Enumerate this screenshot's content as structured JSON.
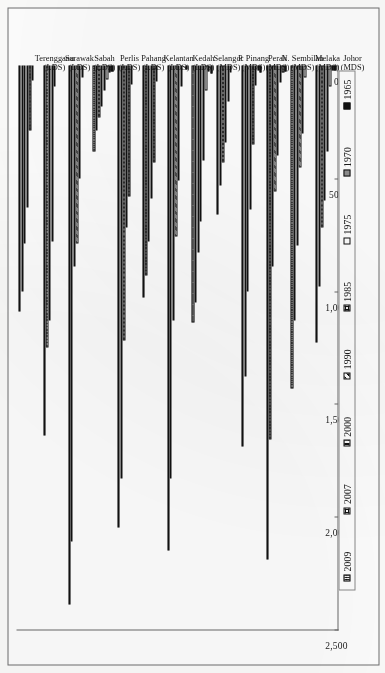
{
  "chart_data": {
    "type": "bar",
    "orientation": "horizontal-rotated",
    "title": "",
    "xlabel": "",
    "ylabel": "",
    "xlim": [
      0,
      2500
    ],
    "grid": false,
    "legend_position": "right",
    "tick_labels": [
      "0",
      "500",
      "1,000",
      "1,500",
      "2,000",
      "2,500"
    ],
    "tick_values": [
      0,
      500,
      1000,
      1500,
      2000,
      2500
    ],
    "categories": [
      "Terengganu\n(LDS)",
      "Sarawak\n(LDS)",
      "Sabah\n(LDS)",
      "Perlis\n(LDS)",
      "Pahang\n(LDS)",
      "Kelantan\n(LDS)",
      "Kedah\n(LDS)",
      "Selangor\n(MDS)",
      "P. Pinang\n(MDS)",
      "Perak\n(MDS)",
      "N. Sembilan\n(MDS)",
      "Melaka\n(MDS)",
      "Johor\n(MDS)"
    ],
    "category_lines": [
      [
        "Terengganu",
        "(LDS)"
      ],
      [
        "Sarawak",
        "(LDS)"
      ],
      [
        "Sabah",
        "(LDS)"
      ],
      [
        "Perlis",
        "(LDS)"
      ],
      [
        "Pahang",
        "(LDS)"
      ],
      [
        "Kelantan",
        "(LDS)"
      ],
      [
        "Kedah",
        "(LDS)"
      ],
      [
        "Selangor",
        "(MDS)"
      ],
      [
        "P. Pinang",
        "(MDS)"
      ],
      [
        "Perak",
        "(MDS)"
      ],
      [
        "N. Sembilan",
        "(MDS)"
      ],
      [
        "Melaka",
        "(MDS)"
      ],
      [
        "Johor",
        "(MDS)"
      ]
    ],
    "series": [
      {
        "name": "2009",
        "pattern": "p-2009",
        "values": [
          1090,
          1640,
          2390,
          380,
          2050,
          1030,
          2150,
          1140,
          660,
          1690,
          2190,
          1430,
          1230
        ]
      },
      {
        "name": "2007",
        "pattern": "p-2007",
        "values": [
          1000,
          1250,
          2110,
          290,
          1830,
          930,
          1830,
          1050,
          530,
          1380,
          1660,
          1130,
          980
        ]
      },
      {
        "name": "2000",
        "pattern": "p-2000",
        "values": [
          790,
          1130,
          890,
          230,
          1220,
          780,
          1130,
          830,
          430,
          1000,
          890,
          800,
          720
        ]
      },
      {
        "name": "1990",
        "pattern": "p-1990",
        "values": [
          630,
          780,
          790,
          180,
          720,
          590,
          760,
          690,
          340,
          640,
          560,
          450,
          600
        ]
      },
      {
        "name": "1985",
        "pattern": "p-1985",
        "values": [
          290,
          95,
          500,
          110,
          580,
          430,
          510,
          420,
          160,
          350,
          400,
          300,
          380
        ]
      },
      {
        "name": "1975",
        "pattern": "p-1975",
        "values": [
          65,
          0,
          55,
          60,
          85,
          70,
          95,
          110,
          30,
          90,
          75,
          55,
          95
        ]
      },
      {
        "name": "1970",
        "pattern": "p-1970",
        "values": [
          0,
          0,
          0,
          30,
          0,
          0,
          0,
          25,
          0,
          20,
          30,
          0,
          20
        ]
      },
      {
        "name": "1965",
        "pattern": "p-1965",
        "values": [
          0,
          0,
          0,
          28,
          0,
          0,
          18,
          35,
          0,
          30,
          26,
          0,
          22
        ]
      }
    ],
    "legend": [
      {
        "label": "2009",
        "pattern": "p-2009"
      },
      {
        "label": "2007",
        "pattern": "p-2007"
      },
      {
        "label": "2000",
        "pattern": "p-2000"
      },
      {
        "label": "1990",
        "pattern": "p-1990"
      },
      {
        "label": "1985",
        "pattern": "p-1985"
      },
      {
        "label": "1975",
        "pattern": "p-1975"
      },
      {
        "label": "1970",
        "pattern": "p-1970"
      },
      {
        "label": "1965",
        "pattern": "p-1965"
      }
    ]
  }
}
